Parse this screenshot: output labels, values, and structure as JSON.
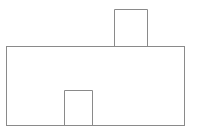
{
  "diagram": {
    "stroke_color": "#8a8a8a",
    "background_color": "#ffffff",
    "shapes": {
      "house_body": {
        "x": 6,
        "y": 46,
        "width": 178,
        "height": 79
      },
      "chimney": {
        "x": 114,
        "y": 9,
        "width": 33,
        "height": 37
      },
      "door": {
        "x": 64,
        "y": 90,
        "width": 28,
        "height": 35
      }
    }
  }
}
